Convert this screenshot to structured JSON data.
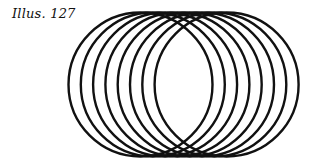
{
  "caption": "Illus. 127",
  "figure": {
    "circle_count": 8,
    "radius": 72,
    "center_y": 84.5,
    "center_x_start": 140.5,
    "center_x_step": 12.3,
    "stroke_color": "#111111",
    "stroke_width": 2.4
  }
}
